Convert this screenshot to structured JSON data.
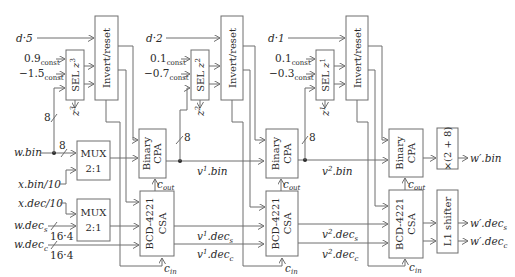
{
  "diagram": {
    "title": "",
    "colors": {
      "line": "#6e6e6e",
      "text": "#2a2a2a",
      "background": "#ffffff"
    },
    "stages": [
      {
        "d_input": "d·5",
        "const_a": "0.9",
        "const_b": "−1.5",
        "const_sub": "const",
        "sel_label": "SEL",
        "sel_z": "z",
        "sel_sup": "3",
        "z_out": "z",
        "z_out_sup": "3",
        "invert_label": "Invert/reset",
        "bus_width": "8"
      },
      {
        "d_input": "d·2",
        "const_a": "0.1",
        "const_b": "−0.7",
        "const_sub": "const",
        "sel_label": "SEL",
        "sel_z": "z",
        "sel_sup": "2",
        "z_out": "z",
        "z_out_sup": "2",
        "invert_label": "Invert/reset",
        "bus_width": "8"
      },
      {
        "d_input": "d·1",
        "const_a": "0.1",
        "const_b": "−0.3",
        "const_sub": "const",
        "sel_label": "SEL",
        "sel_z": "z",
        "sel_sup": "1",
        "z_out": "z",
        "z_out_sup": "1",
        "invert_label": "Invert/reset",
        "bus_width": "8"
      }
    ],
    "inputs": {
      "w_bin": "w.bin",
      "x_bin": "x.bin/10",
      "x_dec": "x.dec/10",
      "w_dec_s": "w.dec",
      "w_dec_s_sub": "s",
      "w_dec_c": "w.dec",
      "w_dec_c_sub": "c",
      "bus_8": "8",
      "bus_164a": "16·4",
      "bus_164b": "16·4"
    },
    "blocks": {
      "mux_top": {
        "line1": "MUX",
        "line2": "2:1"
      },
      "mux_bottom": {
        "line1": "MUX",
        "line2": "2:1"
      },
      "cpa": {
        "line1": "Binary",
        "line2": "CPA"
      },
      "csa": {
        "line1": "BCD-4221",
        "line2": "CSA"
      },
      "mult": "×(2 + 8)",
      "shifter": "L1 shifter",
      "c_out": "c",
      "c_out_sub": "out",
      "c_in": "c",
      "c_in_sub": "in"
    },
    "intermediate": {
      "v1_bin": "v",
      "v1_sup": "1",
      "v1_bin_tail": ".bin",
      "v1_decs": ".dec",
      "v1_decs_sub": "s",
      "v1_decc": ".dec",
      "v1_decc_sub": "c",
      "v2_sup": "2",
      "v2_bin_tail": ".bin",
      "v2_decs": ".dec",
      "v2_decs_sub": "s",
      "v2_decc": ".dec",
      "v2_decc_sub": "c"
    },
    "outputs": {
      "w_prime_bin": "w′.bin",
      "w_prime_decs": "w′.dec",
      "w_prime_decs_sub": "s",
      "w_prime_decc": "w′.dec",
      "w_prime_decc_sub": "c"
    }
  }
}
